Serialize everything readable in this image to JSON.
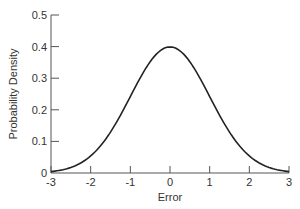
{
  "chart_data": {
    "type": "line",
    "title": "",
    "xlabel": "Error",
    "ylabel": "Probability Density",
    "xlim": [
      -3,
      3
    ],
    "ylim": [
      0,
      0.5
    ],
    "xticks": [
      "-3",
      "-2",
      "-1",
      "0",
      "1",
      "2",
      "3"
    ],
    "yticks": [
      "0",
      "0.1",
      "0.2",
      "0.3",
      "0.4",
      "0.5"
    ],
    "grid": false,
    "legend": null,
    "series": [
      {
        "name": "Standard normal density",
        "x": [
          -3,
          -2.5,
          -2,
          -1.5,
          -1,
          -0.5,
          0,
          0.5,
          1,
          1.5,
          2,
          2.5,
          3
        ],
        "values": [
          0.004,
          0.018,
          0.054,
          0.13,
          0.242,
          0.352,
          0.399,
          0.352,
          0.242,
          0.13,
          0.054,
          0.018,
          0.004
        ]
      }
    ]
  }
}
